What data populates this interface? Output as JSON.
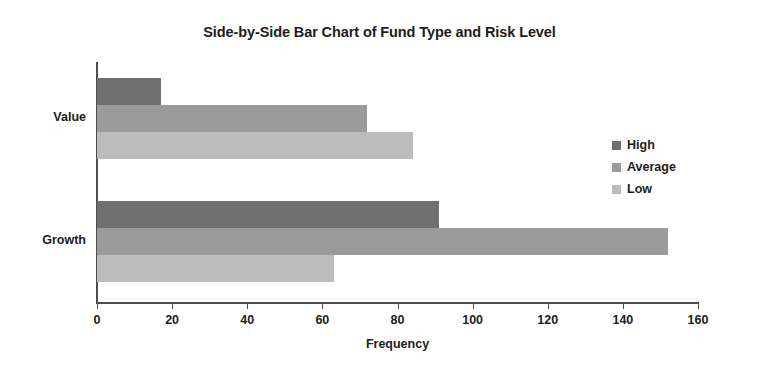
{
  "chart_data": {
    "type": "bar",
    "orientation": "horizontal",
    "title": "Side-by-Side Bar Chart of Fund Type and Risk Level",
    "xlabel": "Frequency",
    "ylabel": "",
    "categories": [
      "Value",
      "Growth"
    ],
    "series": [
      {
        "name": "High",
        "values": [
          17,
          91
        ],
        "color": "#6f6f6f"
      },
      {
        "name": "Average",
        "values": [
          72,
          152
        ],
        "color": "#9b9b9b"
      },
      {
        "name": "Low",
        "values": [
          84,
          63
        ],
        "color": "#bcbcbc"
      }
    ],
    "xlim": [
      0,
      160
    ],
    "xticks": [
      0,
      20,
      40,
      60,
      80,
      100,
      120,
      140,
      160
    ],
    "xtick_labels": [
      "0",
      "20",
      "40",
      "60",
      "80",
      "100",
      "120",
      "140",
      "160"
    ],
    "grid": false,
    "legend_position": "right",
    "legend_entries": [
      "High",
      "Average",
      "Low"
    ],
    "axis_color": "#4d4d4d",
    "background": "#ffffff"
  }
}
